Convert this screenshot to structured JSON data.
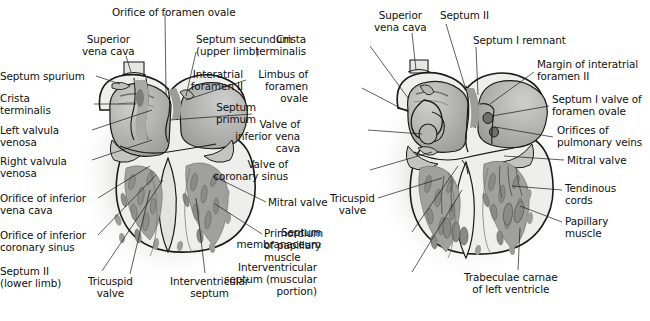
{
  "figure": {
    "panels": [
      {
        "id": "left-panel",
        "name": "earlier-stage-heart-section",
        "labels": [
          {
            "key": "orifice_foramen_ovale",
            "text": "Orifice of foramen ovale",
            "align": "left",
            "x": 112,
            "y": 6,
            "anchor": [
              165,
              14
            ],
            "target": [
              166,
              95
            ]
          },
          {
            "key": "superior_vena_cava_l",
            "text": "Superior\nvena cava",
            "align": "center",
            "x": 88,
            "y": 33,
            "anchor": [
              126,
              56
            ],
            "target": [
              131,
              72
            ]
          },
          {
            "key": "septum_secundum",
            "text": "Septum secundum\n(upper limb)",
            "align": "left",
            "x": 196,
            "y": 33,
            "anchor": [
              196,
              52
            ],
            "target": [
              186,
              96
            ]
          },
          {
            "key": "septum_spurium",
            "text": "Septum spurium",
            "align": "right",
            "x": 6,
            "y": 70,
            "anchor": [
              96,
              76
            ],
            "target": [
              120,
              84
            ]
          },
          {
            "key": "interatrial_foramen_ii",
            "text": "Interatrial\nforamen II",
            "align": "right",
            "x": 243,
            "y": 68,
            "anchor": [
              246,
              80
            ],
            "target": [
              186,
              100
            ]
          },
          {
            "key": "crista_terminalis_l",
            "text": "Crista\nterminalis",
            "align": "right",
            "x": 18,
            "y": 92,
            "anchor": [
              94,
              104
            ],
            "target": [
              136,
              104
            ]
          },
          {
            "key": "septum_primum",
            "text": "Septum\nprimum",
            "align": "right",
            "x": 256,
            "y": 101,
            "anchor": [
              252,
              114
            ],
            "target": [
              170,
              120
            ]
          },
          {
            "key": "left_valvula_venosa",
            "text": "Left valvula\nvenosa",
            "align": "right",
            "x": 16,
            "y": 124,
            "anchor": [
              92,
              130
            ],
            "target": [
              152,
              110
            ]
          },
          {
            "key": "right_valvula_venosa",
            "text": "Right valvula\nvenosa",
            "align": "right",
            "x": 12,
            "y": 155,
            "anchor": [
              92,
              160
            ],
            "target": [
              152,
              140
            ]
          },
          {
            "key": "orifice_inferior_vena_cava",
            "text": "Orifice of inferior\nvena cava",
            "align": "right",
            "x": 2,
            "y": 192,
            "anchor": [
              98,
              198
            ],
            "target": [
              150,
              166
            ]
          },
          {
            "key": "orifice_inferior_coronary_sinus",
            "text": "Orifice of inferior\ncoronary sinus",
            "align": "right",
            "x": 2,
            "y": 229,
            "anchor": [
              98,
              235
            ],
            "target": [
              156,
              175
            ]
          },
          {
            "key": "septum_ii_lower_limb",
            "text": "Septum II\n(lower limb)",
            "align": "right",
            "x": 26,
            "y": 265,
            "anchor": [
              102,
              271
            ],
            "target": [
              163,
              180
            ]
          },
          {
            "key": "tricuspid_valve_l",
            "text": "Tricuspid\nvalve",
            "align": "center",
            "x": 94,
            "y": 275,
            "anchor": [
              130,
              274
            ],
            "target": [
              150,
              190
            ]
          },
          {
            "key": "interventricular_septum_l",
            "text": "Interventricular\nseptum",
            "align": "center",
            "x": 176,
            "y": 275,
            "anchor": [
              205,
              273
            ],
            "target": [
              196,
              198
            ]
          },
          {
            "key": "mitral_valve_l",
            "text": "Mitral valve",
            "align": "left",
            "x": 268,
            "y": 196,
            "anchor": [
              266,
              202
            ],
            "target": [
              213,
              176
            ]
          },
          {
            "key": "primordium_papillary_muscle",
            "text": "Primordium\nof papillary\nmuscle",
            "align": "left",
            "x": 264,
            "y": 227,
            "anchor": [
              262,
              234
            ],
            "target": [
              215,
              204
            ]
          }
        ]
      },
      {
        "id": "right-panel",
        "name": "later-stage-heart-section",
        "labels": [
          {
            "key": "superior_vena_cava_r",
            "text": "Superior\nvena cava",
            "align": "center",
            "x": 380,
            "y": 9,
            "anchor": [
              412,
              33
            ],
            "target": [
              416,
              70
            ]
          },
          {
            "key": "septum_ii_r",
            "text": "Septum II",
            "align": "left",
            "x": 440,
            "y": 9,
            "anchor": [
              446,
              24
            ],
            "target": [
              466,
              90
            ]
          },
          {
            "key": "septum_i_remnant",
            "text": "Septum I remnant",
            "align": "left",
            "x": 473,
            "y": 34,
            "anchor": [
              476,
              47
            ],
            "target": [
              478,
              95
            ]
          },
          {
            "key": "crista_terminalis_r",
            "text": "Crista\nterminalis",
            "align": "right",
            "x": 306,
            "y": 33,
            "anchor": [
              370,
              46
            ],
            "target": [
              408,
              98
            ]
          },
          {
            "key": "margin_interatrial_foramen_ii",
            "text": "Margin of interatrial\nforamen II",
            "align": "left",
            "x": 537,
            "y": 58,
            "anchor": [
              534,
              72
            ],
            "target": [
              490,
              104
            ]
          },
          {
            "key": "limbus_foramen_ovale",
            "text": "Limbus of\nforamen\novale",
            "align": "right",
            "x": 308,
            "y": 68,
            "anchor": [
              362,
              88
            ],
            "target": [
              408,
              112
            ]
          },
          {
            "key": "septum_i_valve_foramen_ovale",
            "text": "Septum I valve of\nforamen ovale",
            "align": "left",
            "x": 552,
            "y": 93,
            "anchor": [
              549,
              106
            ],
            "target": [
              492,
              116
            ]
          },
          {
            "key": "valve_inferior_vena_cava",
            "text": "Valve of\ninferior vena\ncava",
            "align": "right",
            "x": 300,
            "y": 118,
            "anchor": [
              368,
              130
            ],
            "target": [
              422,
              134
            ]
          },
          {
            "key": "orifices_pulmonary_veins",
            "text": "Orifices of\npulmonary veins",
            "align": "left",
            "x": 557,
            "y": 124,
            "anchor": [
              553,
              137
            ],
            "target": [
              495,
              127
            ]
          },
          {
            "key": "mitral_valve_r",
            "text": "Mitral valve",
            "align": "left",
            "x": 567,
            "y": 154,
            "anchor": [
              564,
              160
            ],
            "target": [
              504,
              156
            ]
          },
          {
            "key": "valve_coronary_sinus",
            "text": "Valve of\ncoronary sinus",
            "align": "right",
            "x": 288,
            "y": 158,
            "anchor": [
              370,
              170
            ],
            "target": [
              432,
              152
            ]
          },
          {
            "key": "tendinous_cords",
            "text": "Tendinous\ncords",
            "align": "left",
            "x": 565,
            "y": 182,
            "anchor": [
              562,
              190
            ],
            "target": [
              512,
              186
            ]
          },
          {
            "key": "tricuspid_valve_r",
            "text": "Tricuspid\nvalve",
            "align": "center",
            "x": 336,
            "y": 192,
            "anchor": [
              378,
              198
            ],
            "target": [
              442,
              178
            ]
          },
          {
            "key": "papillary_muscle",
            "text": "Papillary\nmuscle",
            "align": "left",
            "x": 565,
            "y": 215,
            "anchor": [
              562,
              222
            ],
            "target": [
              520,
              206
            ]
          },
          {
            "key": "septum_membranaceum",
            "text": "Septum\nmembranaceum",
            "align": "right",
            "x": 321,
            "y": 226,
            "anchor": [
              412,
              232
            ],
            "target": [
              458,
              166
            ]
          },
          {
            "key": "interventricular_septum_muscular",
            "text": "Interventricular\nseptum (muscular\nportion)",
            "align": "right",
            "x": 317,
            "y": 261,
            "anchor": [
              412,
              272
            ],
            "target": [
              462,
              190
            ]
          },
          {
            "key": "trabeculae_carnae_left_ventricle",
            "text": "Trabeculae carnae\nof left ventricle",
            "align": "center",
            "x": 470,
            "y": 271,
            "anchor": [
              518,
              270
            ],
            "target": [
              520,
              228
            ]
          }
        ]
      }
    ],
    "palette": {
      "outline": "#1a1a1a",
      "myocardium_light": "#e9e9e7",
      "endocardium_mid": "#b8b8b6",
      "chamber_wall": "#a8a8a6",
      "trabeculae_dark": "#8f8f8d",
      "valve_tissue": "#9a9a98",
      "shadow": "#d9d9d7",
      "paper": "#ffffff",
      "text": "#101010"
    }
  }
}
